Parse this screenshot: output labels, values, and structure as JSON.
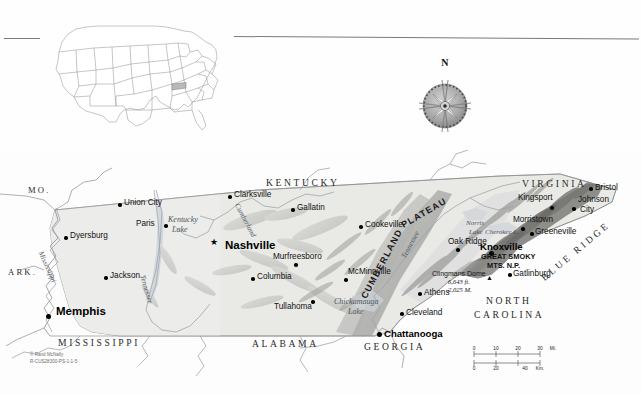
{
  "map": {
    "title_state": "Tennessee",
    "compass": {
      "north_label": "N"
    },
    "credit_line1": "© Rand McNally",
    "credit_line2": "R-CUS28300-PS-1-1-5",
    "scale": {
      "miles_ticks": [
        "0",
        "10",
        "20",
        "30"
      ],
      "miles_unit": "Mi.",
      "km_ticks": [
        "0",
        "20",
        "40"
      ],
      "km_unit": "Km."
    },
    "states": [
      {
        "name": "MO.",
        "x": 28,
        "y": 42
      },
      {
        "name": "ARK.",
        "x": 18,
        "y": 122
      },
      {
        "name": "MISSISSIPPI",
        "x": 62,
        "y": 192
      },
      {
        "name": "ALABAMA",
        "x": 255,
        "y": 193
      },
      {
        "name": "GEORGIA",
        "x": 370,
        "y": 196
      },
      {
        "name": "KENTUCKY",
        "x": 272,
        "y": 33
      },
      {
        "name": "VIRGINIA",
        "x": 527,
        "y": 33
      },
      {
        "name": "NORTH",
        "x": 488,
        "y": 150
      },
      {
        "name": "CAROLINA",
        "x": 480,
        "y": 163
      }
    ],
    "cities": [
      {
        "name": "Union City",
        "x": 124,
        "y": 54,
        "dx": 0,
        "dy": 0,
        "size": "small",
        "dot": "right"
      },
      {
        "name": "Paris",
        "x": 124,
        "y": 76,
        "size": "small",
        "dot": "right"
      },
      {
        "name": "Dyersburg",
        "x": 70,
        "y": 88,
        "size": "small",
        "dot": "left"
      },
      {
        "name": "Jackson",
        "x": 110,
        "y": 128,
        "size": "small",
        "dot": "left"
      },
      {
        "name": "Memphis",
        "x": 56,
        "y": 160,
        "size": "major",
        "dot": "left"
      },
      {
        "name": "Clarksville",
        "x": 234,
        "y": 46,
        "size": "small",
        "dot": "left"
      },
      {
        "name": "Gallatin",
        "x": 297,
        "y": 59,
        "size": "small",
        "dot": "left"
      },
      {
        "name": "Nashville",
        "x": 225,
        "y": 95,
        "size": "capital",
        "dot": "star"
      },
      {
        "name": "Murfreesboro",
        "x": 273,
        "y": 107,
        "size": "small",
        "dot": "below"
      },
      {
        "name": "Columbia",
        "x": 257,
        "y": 128,
        "size": "small",
        "dot": "left"
      },
      {
        "name": "Tullahoma",
        "x": 274,
        "y": 157,
        "size": "small",
        "dot": "above"
      },
      {
        "name": "McMinnville",
        "x": 348,
        "y": 122,
        "size": "small",
        "dot": "below"
      },
      {
        "name": "Cookeville",
        "x": 365,
        "y": 76,
        "size": "small",
        "dot": "left"
      },
      {
        "name": "Chattanooga",
        "x": 384,
        "y": 184,
        "size": "big",
        "dot": "left"
      },
      {
        "name": "Cleveland",
        "x": 406,
        "y": 163,
        "size": "small",
        "dot": "left"
      },
      {
        "name": "Athens",
        "x": 424,
        "y": 143,
        "size": "small",
        "dot": "left"
      },
      {
        "name": "Oak Ridge",
        "x": 448,
        "y": 92,
        "size": "small",
        "dot": "below"
      },
      {
        "name": "Knoxville",
        "x": 480,
        "y": 100,
        "size": "big",
        "dot": "below"
      },
      {
        "name": "Gatlinburg",
        "x": 513,
        "y": 124,
        "size": "small",
        "dot": "left"
      },
      {
        "name": "Greeneville",
        "x": 535,
        "y": 82,
        "size": "small",
        "dot": "left"
      },
      {
        "name": "Morristown",
        "x": 513,
        "y": 70,
        "size": "small",
        "dot": "below"
      },
      {
        "name": "Kingsport",
        "x": 518,
        "y": 48,
        "size": "small",
        "dot": "right"
      },
      {
        "name": "Johnson",
        "x": 578,
        "y": 50,
        "size": "small",
        "dot": "none"
      },
      {
        "name": "City",
        "x": 578,
        "y": 60,
        "size": "small",
        "dot": "left"
      },
      {
        "name": "Bristol",
        "x": 595,
        "y": 38,
        "size": "small",
        "dot": "left"
      }
    ],
    "water": [
      {
        "name": "Kentucky",
        "x": 172,
        "y": 70
      },
      {
        "name": "Lake",
        "x": 176,
        "y": 80
      },
      {
        "name": "Norris",
        "x": 469,
        "y": 74
      },
      {
        "name": "Lake",
        "x": 472,
        "y": 83
      },
      {
        "name": "Cherokee L.",
        "x": 489,
        "y": 82
      },
      {
        "name": "Chickamauga",
        "x": 340,
        "y": 152
      },
      {
        "name": "Lake",
        "x": 352,
        "y": 162
      }
    ],
    "rivers": [
      {
        "name": "Mississippi",
        "x": 56,
        "y": 108,
        "rot": 66
      },
      {
        "name": "Cumberland",
        "x": 248,
        "y": 58,
        "rot": 62
      },
      {
        "name": "Tennessee",
        "x": 150,
        "y": 132,
        "rot": 72
      },
      {
        "name": "Tennessee",
        "x": 406,
        "y": 112,
        "rot": 62
      }
    ],
    "features": [
      {
        "name": "CUMBERLAND",
        "x": 382,
        "y": 128,
        "rot": -62,
        "kind": "range"
      },
      {
        "name": "PLATEAU",
        "x": 420,
        "y": 62,
        "rot": -30,
        "kind": "range"
      },
      {
        "name": "BLUE RIDGE",
        "x": 560,
        "y": 105,
        "rot": -40,
        "kind": "range2"
      }
    ],
    "park": {
      "line1": "GREAT SMOKY",
      "line2": "MTS. N.P.",
      "x": 481,
      "y": 107
    },
    "peak": {
      "name": "Clingmans Dome",
      "elev_ft": "6,643 ft.",
      "elev_m": "2,025 M.",
      "x": 463,
      "y": 123
    }
  }
}
